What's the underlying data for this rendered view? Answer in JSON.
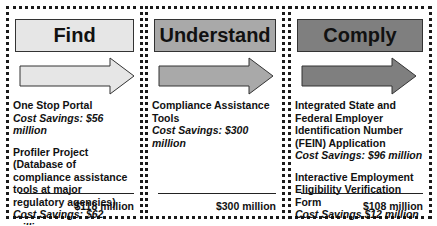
{
  "panels": [
    {
      "title": "Find",
      "header_color": "#e6e6e6",
      "arrow_color": "#e6e6e6",
      "items": [
        {
          "name": "One Stop Portal",
          "savings": "Cost Savings: $56 million"
        },
        {
          "name": "Profiler Project (Database of compliance assistance tools at major regulatory agencies)",
          "savings": "Cost Savings: $62 million"
        }
      ],
      "total": "$118 million"
    },
    {
      "title": "Understand",
      "header_color": "#a9a9a9",
      "arrow_color": "#a9a9a9",
      "items": [
        {
          "name": "Compliance Assistance Tools",
          "savings": "Cost Savings: $300 million"
        }
      ],
      "total": "$300 million"
    },
    {
      "title": "Comply",
      "header_color": "#7f7f7f",
      "arrow_color": "#7f7f7f",
      "items": [
        {
          "name": "Integrated State and Federal Employer Identification Number (FEIN) Application",
          "savings": "Cost Savings: $96 million"
        },
        {
          "name": "Interactive Employment Eligibility Verification Form",
          "savings": "Cost Savings $12 million"
        }
      ],
      "total": "$108 million"
    }
  ]
}
